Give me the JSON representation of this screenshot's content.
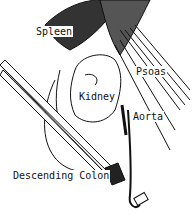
{
  "diagram": {
    "type": "anatomical-illustration",
    "labels": [
      {
        "id": "spleen",
        "text": "Spleen"
      },
      {
        "id": "psoas",
        "text": "Psoas"
      },
      {
        "id": "kidney",
        "text": "Kidney"
      },
      {
        "id": "aorta",
        "text": "Aorta"
      },
      {
        "id": "descending-colon",
        "text": "Descending Colon"
      }
    ]
  },
  "colors": {
    "ink": "#111111",
    "background": "#ffffff"
  }
}
